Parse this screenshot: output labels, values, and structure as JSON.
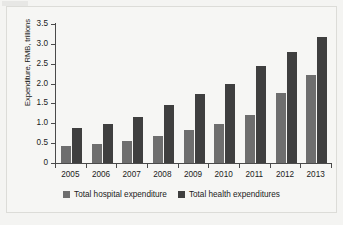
{
  "chart_data": {
    "type": "bar",
    "title": "",
    "xlabel": "",
    "ylabel": "Expenditure, RMB, trillions",
    "ylim": [
      0,
      3.5
    ],
    "yticks": [
      "0",
      "0.5",
      "1.0",
      "1.5",
      "2.0",
      "2.5",
      "3.0",
      "3.5"
    ],
    "ytick_values": [
      0,
      0.5,
      1.0,
      1.5,
      2.0,
      2.5,
      3.0,
      3.5
    ],
    "grid": false,
    "legend_position": "bottom-center",
    "categories": [
      "2005",
      "2006",
      "2007",
      "2008",
      "2009",
      "2010",
      "2011",
      "2012",
      "2013"
    ],
    "series": [
      {
        "name": "Total hospital expenditure",
        "color": "#6e6e6e",
        "values": [
          0.42,
          0.48,
          0.56,
          0.69,
          0.83,
          0.98,
          1.22,
          1.76,
          2.22
        ]
      },
      {
        "name": "Total health expenditures",
        "color": "#3f3f3f",
        "values": [
          0.87,
          0.97,
          1.16,
          1.45,
          1.75,
          2.0,
          2.45,
          2.8,
          3.18
        ]
      }
    ]
  }
}
